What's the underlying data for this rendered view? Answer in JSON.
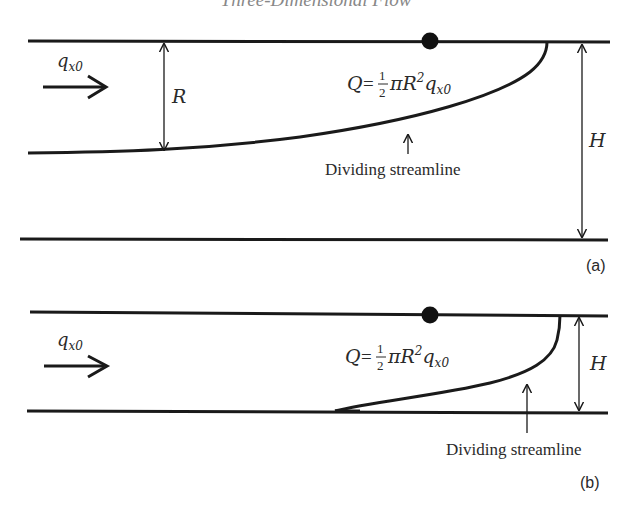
{
  "header": {
    "title": "Three-Dimensional Flow"
  },
  "panel_a": {
    "label": "(a)",
    "inflow_label": "q",
    "inflow_sub": "x0",
    "radius_label": "R",
    "height_label": "H",
    "discharge_Q": "Q",
    "discharge_eq": "=",
    "discharge_num": "1",
    "discharge_den": "2",
    "discharge_rest": "πR",
    "discharge_exp": "2",
    "discharge_q": "q",
    "discharge_sub": "x0",
    "streamline_label": "Dividing streamline"
  },
  "panel_b": {
    "label": "(b)",
    "inflow_label": "q",
    "inflow_sub": "x0",
    "height_label": "H",
    "discharge_Q": "Q",
    "discharge_eq": "=",
    "discharge_num": "1",
    "discharge_den": "2",
    "discharge_rest": "πR",
    "discharge_exp": "2",
    "discharge_q": "q",
    "discharge_sub": "x0",
    "streamline_label": "Dividing streamline"
  },
  "colors": {
    "ink": "#1a1a1a",
    "text": "#2a2a2a"
  }
}
